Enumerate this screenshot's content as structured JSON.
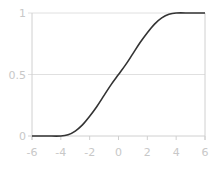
{
  "chart_data": {
    "type": "line",
    "title": "",
    "xlabel": "",
    "ylabel": "",
    "xlim": [
      -6,
      6
    ],
    "ylim": [
      0,
      1
    ],
    "grid": true,
    "legend": null,
    "x_ticks": [
      "-6",
      "-4",
      "-2",
      "0",
      "2",
      "4",
      "6"
    ],
    "y_ticks": [
      "0",
      "0.5",
      "1"
    ],
    "series": [
      {
        "name": "sigmoid",
        "color": "#333333",
        "x": [
          -6,
          -5,
          -4,
          -3.5,
          -3,
          -2.5,
          -2,
          -1.5,
          -1,
          -0.5,
          0,
          0.5,
          1,
          1.5,
          2,
          2.5,
          3,
          3.5,
          4,
          5,
          6
        ],
        "y": [
          0,
          0,
          0,
          0.01,
          0.04,
          0.09,
          0.16,
          0.24,
          0.33,
          0.42,
          0.5,
          0.58,
          0.67,
          0.76,
          0.84,
          0.91,
          0.96,
          0.99,
          1,
          1,
          1
        ]
      }
    ]
  },
  "colors": {
    "axis": "#d0d0d0",
    "grid": "#e0e0e0",
    "tick_label": "#c8c8c8",
    "line": "#333333"
  }
}
